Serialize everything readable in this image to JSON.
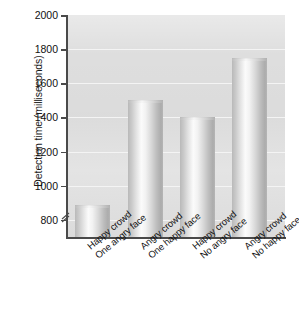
{
  "chart_data": {
    "type": "bar",
    "title": "",
    "subtitle": "",
    "xlabel": "",
    "ylabel": "Detection time (milliseconds)",
    "categories": [
      "Happy crowd One angry face",
      "Angry crowd One happy face",
      "Happy crowd No angry face",
      "Angry crowd No happy face"
    ],
    "category_lines": [
      [
        "Happy crowd",
        "One angry face"
      ],
      [
        "Angry crowd",
        "One happy face"
      ],
      [
        "Happy crowd",
        "No angry face"
      ],
      [
        "Angry crowd",
        "No happy face"
      ]
    ],
    "values": [
      890,
      1500,
      1400,
      1750
    ],
    "ylim": [
      700,
      2000
    ],
    "yticks": [
      800,
      1000,
      1200,
      1400,
      1600,
      1800,
      2000
    ],
    "ytick_labels": [
      "800",
      "1000",
      "1200",
      "1400",
      "1600",
      "1800",
      "2000"
    ],
    "axis_break": true,
    "grid": true,
    "grid_color": "#f4f4f4",
    "legend": null,
    "legend_position": "none",
    "plot_background": "#dedede",
    "bar_color": "#d8d8d8",
    "axis_color": "#4a4a4a",
    "text_color": "#111111"
  },
  "axis": {
    "y_title": "Detection time (milliseconds)",
    "break_icon": "axis-break-icon"
  }
}
